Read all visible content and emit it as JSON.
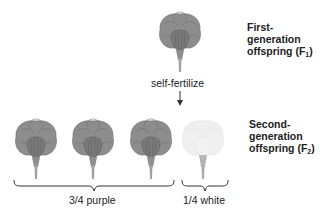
{
  "f1": {
    "label_line1": "First-",
    "label_line2": "generation",
    "label_line3": "offspring (F",
    "label_sub": "1",
    "label_close": ")",
    "flower_color": "purple"
  },
  "step": {
    "label": "self-fertilize",
    "arrow": "down-arrow-icon"
  },
  "f2": {
    "label_line1": "Second-",
    "label_line2": "generation",
    "label_line3": "offspring (F",
    "label_sub": "2",
    "label_close": ")",
    "flowers": [
      {
        "color": "purple"
      },
      {
        "color": "purple"
      },
      {
        "color": "purple"
      },
      {
        "color": "white"
      }
    ],
    "groups": [
      {
        "label": "3/4 purple"
      },
      {
        "label": "1/4 white"
      }
    ]
  },
  "colors": {
    "purple_petal": "#8a8a8a",
    "purple_petal_dark": "#6e6e6e",
    "white_petal": "#ececec",
    "stem": "#9a9a9a",
    "line": "#333333"
  }
}
